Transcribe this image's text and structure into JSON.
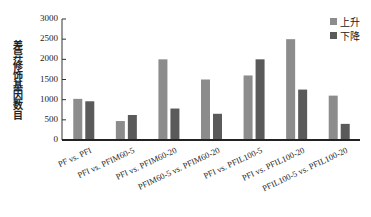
{
  "chart_data": {
    "type": "bar",
    "title": "",
    "xlabel": "",
    "ylabel": "差异修饰基因数目",
    "ylim": [
      0,
      3000
    ],
    "yticks": [
      0,
      500,
      1000,
      1500,
      2000,
      2500,
      3000
    ],
    "grid": false,
    "legend_position": "top-right",
    "categories": [
      "PF vs. PFI",
      "PFI vs. PFIM60-5",
      "PFI vs. PFIM60-20",
      "PFIM60-5 vs. PFIM60-20",
      "PFI vs. PFIL100-5",
      "PFI vs. PFIL100-20",
      "PFIL100-5 vs. PFIL100-20"
    ],
    "series": [
      {
        "name": "上升",
        "color": "#8c8c8c",
        "values": [
          1020,
          470,
          2000,
          1500,
          1600,
          2500,
          1100
        ]
      },
      {
        "name": "下降",
        "color": "#5a5a5a",
        "values": [
          960,
          620,
          780,
          650,
          2000,
          1250,
          400
        ]
      }
    ]
  }
}
